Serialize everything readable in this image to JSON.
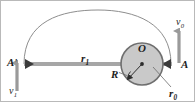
{
  "figure": {
    "kind": "orbital-transfer-diagram",
    "colors": {
      "background": "#ffffff",
      "border": "#b9b9b9",
      "trajectory": "#8e8e8e",
      "axis_bar": "#a6a6a6",
      "circle_fill": "#c9c9c9",
      "circle_stroke": "#6f6f6f",
      "arrow": "#9a9a9a",
      "leader": "#6b6b6b",
      "text": "#1d1d1d"
    },
    "labels": {
      "apoapsis_point": "A",
      "apoapsis_prime_point": "A",
      "apoapsis_prime_mark": "'",
      "radius_far": "r",
      "radius_far_sub": "1",
      "center": "O",
      "body_radius": "R",
      "radius_near": "r",
      "radius_near_sub": "0",
      "velocity_at_A": "v",
      "velocity_at_A_sub": "0",
      "velocity_at_Aprime": "v",
      "velocity_at_Aprime_sub": "1"
    },
    "geometry": {
      "point_A_x": 170,
      "point_A_y": 63,
      "point_Aprime_x": 23,
      "point_Aprime_y": 63,
      "center_O_x": 141,
      "center_O_y": 63,
      "circle_radius": 21,
      "ellipse_apex_y": 10,
      "velocity_A_direction": "up",
      "velocity_Aprime_direction": "down"
    }
  }
}
